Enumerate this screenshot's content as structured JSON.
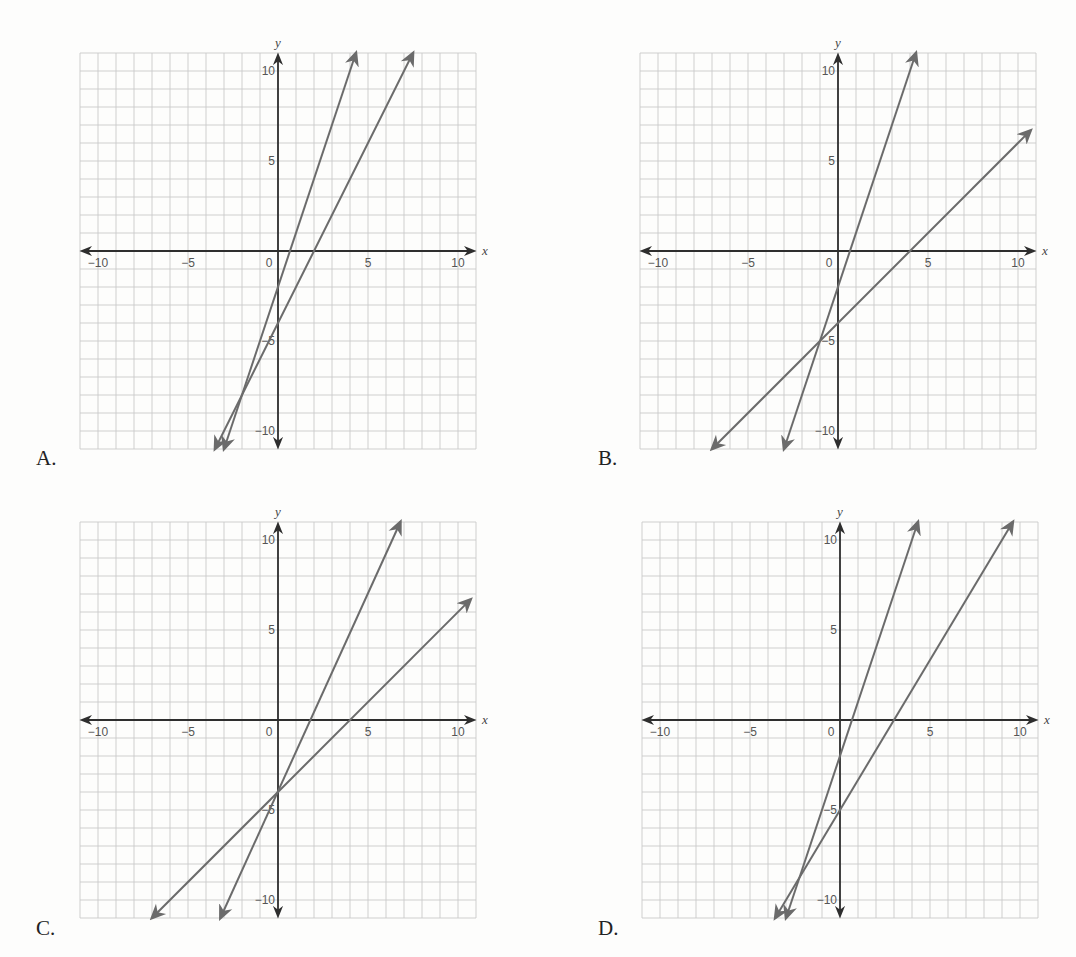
{
  "options": [
    {
      "label": "A.",
      "id": "A"
    },
    {
      "label": "B.",
      "id": "B"
    },
    {
      "label": "C.",
      "id": "C"
    },
    {
      "label": "D.",
      "id": "D"
    }
  ],
  "axis": {
    "x_name": "x",
    "y_name": "y",
    "x_ticks": [
      {
        "v": -10,
        "t": "−10"
      },
      {
        "v": -5,
        "t": "−5"
      },
      {
        "v": 0,
        "t": "0"
      },
      {
        "v": 5,
        "t": "5"
      },
      {
        "v": 10,
        "t": "10"
      }
    ],
    "y_ticks": [
      {
        "v": 10,
        "t": "10"
      },
      {
        "v": 5,
        "t": "5"
      },
      {
        "v": -5,
        "t": "−5"
      },
      {
        "v": -10,
        "t": "−10"
      }
    ]
  },
  "colors": {
    "grid": "#c9c9c9",
    "axis": "#2e2e2e",
    "line": "#6b6b6b",
    "label": "#222222"
  },
  "chart_data": [
    {
      "type": "line",
      "title": "A.",
      "xlabel": "x",
      "ylabel": "y",
      "xlim": [
        -11,
        11
      ],
      "ylim": [
        -11,
        11
      ],
      "grid": true,
      "x_ticks": [
        -10,
        -5,
        0,
        5,
        10
      ],
      "y_ticks": [
        -10,
        -5,
        5,
        10
      ],
      "series": [
        {
          "name": "line 1",
          "slope": 3,
          "intercept": -2,
          "points": [
            [
              -3,
              -11
            ],
            [
              4.33,
              11
            ]
          ]
        },
        {
          "name": "line 2",
          "slope": 2,
          "intercept": -4,
          "points": [
            [
              -3.5,
              -11
            ],
            [
              7.5,
              11
            ]
          ]
        }
      ]
    },
    {
      "type": "line",
      "title": "B.",
      "xlabel": "x",
      "ylabel": "y",
      "xlim": [
        -11,
        11
      ],
      "ylim": [
        -11,
        11
      ],
      "grid": true,
      "x_ticks": [
        -10,
        -5,
        0,
        5,
        10
      ],
      "y_ticks": [
        -10,
        -5,
        5,
        10
      ],
      "series": [
        {
          "name": "line 1",
          "slope": 3,
          "intercept": -2,
          "points": [
            [
              -3,
              -11
            ],
            [
              4.33,
              11
            ]
          ]
        },
        {
          "name": "line 2",
          "slope": 1,
          "intercept": -4,
          "points": [
            [
              -7,
              -11
            ],
            [
              10.7,
              6.7
            ]
          ]
        }
      ],
      "annotations": [
        "lines intersect near (-1, -5)"
      ]
    },
    {
      "type": "line",
      "title": "C.",
      "xlabel": "x",
      "ylabel": "y",
      "xlim": [
        -11,
        11
      ],
      "ylim": [
        -11,
        11
      ],
      "grid": true,
      "x_ticks": [
        -10,
        -5,
        0,
        5,
        10
      ],
      "y_ticks": [
        -10,
        -5,
        5,
        10
      ],
      "series": [
        {
          "name": "line 1",
          "slope": 2.2,
          "intercept": -4,
          "points": [
            [
              -3.2,
              -11
            ],
            [
              6.8,
              11
            ]
          ]
        },
        {
          "name": "line 2",
          "slope": 1,
          "intercept": -4,
          "points": [
            [
              -7,
              -11
            ],
            [
              10.7,
              6.7
            ]
          ]
        }
      ],
      "annotations": [
        "lines intersect at (0, -4)"
      ]
    },
    {
      "type": "line",
      "title": "D.",
      "xlabel": "x",
      "ylabel": "y",
      "xlim": [
        -11,
        11
      ],
      "ylim": [
        -11,
        11
      ],
      "grid": true,
      "x_ticks": [
        -10,
        -5,
        0,
        5,
        10
      ],
      "y_ticks": [
        -10,
        -5,
        5,
        10
      ],
      "series": [
        {
          "name": "line 1",
          "slope": 3,
          "intercept": -2,
          "points": [
            [
              -3,
              -11
            ],
            [
              4.33,
              11
            ]
          ]
        },
        {
          "name": "line 2",
          "slope": 1.6667,
          "intercept": -5,
          "points": [
            [
              -3.6,
              -11
            ],
            [
              9.6,
              11
            ]
          ]
        }
      ],
      "annotations": [
        "lines intersect near (-2.25, -8.75)"
      ]
    }
  ]
}
